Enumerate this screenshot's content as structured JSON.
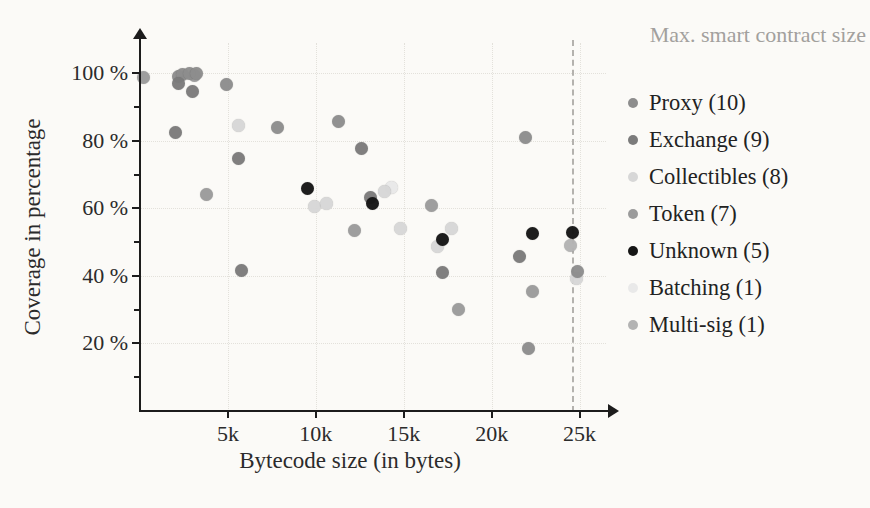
{
  "figure": {
    "background": "#fbfaf7",
    "annotation": {
      "label": "Max. smart contract size",
      "color": "#a2a09d",
      "x_bytes": 24576
    },
    "axes": {
      "x": {
        "label": "Bytecode size (in bytes)",
        "range_bytes": [
          0,
          26500
        ],
        "ticks": [
          {
            "value": 5000,
            "label": "5k"
          },
          {
            "value": 10000,
            "label": "10k"
          },
          {
            "value": 15000,
            "label": "15k"
          },
          {
            "value": 20000,
            "label": "20k"
          },
          {
            "value": 25000,
            "label": "25k"
          }
        ]
      },
      "y": {
        "label": "Coverage in percentage",
        "range_pct": [
          0,
          109
        ],
        "major_ticks": [
          {
            "value": 100,
            "label": "100 %"
          },
          {
            "value": 80,
            "label": "80 %"
          },
          {
            "value": 60,
            "label": "60 %"
          },
          {
            "value": 40,
            "label": "40 %"
          },
          {
            "value": 20,
            "label": "20 %"
          }
        ],
        "minor_ticks": [
          10,
          30,
          50,
          70,
          90
        ]
      }
    },
    "legend": {
      "items": [
        {
          "label": "Proxy (10)",
          "color": "#8d8d8d"
        },
        {
          "label": "Exchange (9)",
          "color": "#7b7b7b"
        },
        {
          "label": "Collectibles (8)",
          "color": "#d7d7d7"
        },
        {
          "label": "Token (7)",
          "color": "#9b9b9b"
        },
        {
          "label": "Unknown (5)",
          "color": "#151515"
        },
        {
          "label": "Batching (1)",
          "color": "#e9e9e9"
        },
        {
          "label": "Multi-sig (1)",
          "color": "#b3b3b3"
        }
      ]
    }
  },
  "chart_data": {
    "type": "scatter",
    "title": "",
    "xlabel": "Bytecode size (in bytes)",
    "ylabel": "Coverage in percentage",
    "xlim": [
      0,
      26500
    ],
    "ylim": [
      0,
      109
    ],
    "grid": true,
    "legend_position": "right",
    "annotation_line": {
      "x": 24576,
      "label": "Max. smart contract size",
      "style": "dashed"
    },
    "series": [
      {
        "name": "Batching (1)",
        "color": "#e9e9e9",
        "points": [
          [
            14300,
            66.3
          ]
        ]
      },
      {
        "name": "Collectibles (8)",
        "color": "#d7d7d7",
        "points": [
          [
            5600,
            84.6
          ],
          [
            9900,
            60.7
          ],
          [
            10600,
            61.5
          ],
          [
            13900,
            65.1
          ],
          [
            14800,
            54.1
          ],
          [
            17700,
            54.1
          ],
          [
            16900,
            48.8
          ],
          [
            24800,
            39.3
          ]
        ]
      },
      {
        "name": "Multi-sig (1)",
        "color": "#b3b3b3",
        "points": [
          [
            24500,
            49.1
          ]
        ]
      },
      {
        "name": "Token (7)",
        "color": "#9b9b9b",
        "points": [
          [
            200,
            98.8
          ],
          [
            3100,
            99.5
          ],
          [
            3800,
            64.2
          ],
          [
            12200,
            53.6
          ],
          [
            16600,
            60.9
          ],
          [
            18100,
            30.2
          ],
          [
            22300,
            35.5
          ]
        ]
      },
      {
        "name": "Proxy (10)",
        "color": "#8d8d8d",
        "points": [
          [
            2200,
            99.1
          ],
          [
            2400,
            99.7
          ],
          [
            2800,
            100
          ],
          [
            3200,
            100
          ],
          [
            4900,
            96.7
          ],
          [
            7800,
            84.0
          ],
          [
            11300,
            85.8
          ],
          [
            21900,
            81.1
          ],
          [
            22100,
            18.6
          ],
          [
            24900,
            41.4
          ]
        ]
      },
      {
        "name": "Exchange (9)",
        "color": "#7b7b7b",
        "points": [
          [
            2200,
            97.0
          ],
          [
            3000,
            94.7
          ],
          [
            2000,
            82.5
          ],
          [
            5600,
            74.9
          ],
          [
            5800,
            41.7
          ],
          [
            12600,
            77.8
          ],
          [
            13100,
            63.3
          ],
          [
            17200,
            41.1
          ],
          [
            21600,
            45.9
          ]
        ]
      },
      {
        "name": "Unknown (5)",
        "color": "#151515",
        "points": [
          [
            9500,
            66.0
          ],
          [
            13200,
            61.5
          ],
          [
            17200,
            50.9
          ],
          [
            22300,
            52.7
          ],
          [
            24600,
            53.0
          ]
        ]
      }
    ]
  }
}
